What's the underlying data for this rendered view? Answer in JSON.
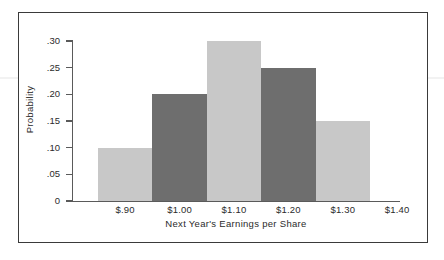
{
  "chart_data": {
    "type": "bar",
    "title": "",
    "xlabel": "Next Year's Earnings per Share",
    "ylabel": "Probability",
    "categories": [
      "$.90",
      "$1.00",
      "$1.10",
      "$1.20",
      "$1.30"
    ],
    "values": [
      0.1,
      0.2,
      0.3,
      0.25,
      0.15
    ],
    "bar_colors": [
      "#c8c8c8",
      "#6e6e6e",
      "#c8c8c8",
      "#6e6e6e",
      "#c8c8c8"
    ],
    "x_tick_labels": [
      "$.90",
      "$1.00",
      "$1.10",
      "$1.20",
      "$1.30",
      "$1.40"
    ],
    "y_tick_labels": [
      ".30",
      ".25",
      ".20",
      ".15",
      ".10",
      ".05",
      "0"
    ],
    "y_tick_values": [
      0.3,
      0.25,
      0.2,
      0.15,
      0.1,
      0.05,
      0
    ],
    "ylim": [
      0,
      0.3
    ],
    "grid": false,
    "legend": "none",
    "bars": [
      {
        "label": "$.90",
        "value": 0.1,
        "value_label": ".10",
        "shade": "light"
      },
      {
        "label": "$1.00",
        "value": 0.2,
        "value_label": ".20",
        "shade": "dark"
      },
      {
        "label": "$1.10",
        "value": 0.3,
        "value_label": ".30",
        "shade": "light"
      },
      {
        "label": "$1.20",
        "value": 0.25,
        "value_label": ".25",
        "shade": "dark"
      },
      {
        "label": "$1.30",
        "value": 0.15,
        "value_label": ".15",
        "shade": "light"
      }
    ]
  },
  "figure": {
    "frame_color": "#3a3a3a",
    "background": "#ffffff",
    "axis_color": "#5a5a5a",
    "text_color": "#2b2b2b",
    "light_bar": "#c8c8c8",
    "dark_bar": "#6e6e6e"
  }
}
